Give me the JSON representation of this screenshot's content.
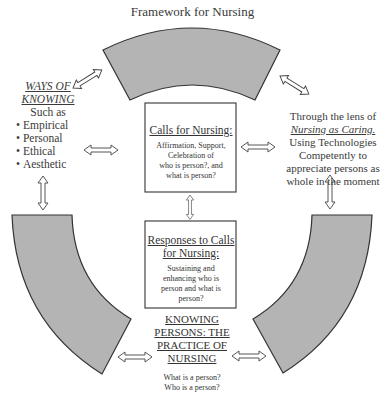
{
  "title": "Framework for Nursing",
  "ways_of_knowing": {
    "heading_line1": "WAYS OF",
    "heading_line2": "KNOWING",
    "intro": "Such as",
    "items": [
      "Empirical",
      "Personal",
      "Ethical",
      "Aesthetic"
    ]
  },
  "lens": {
    "line1": "Through the lens of",
    "emphasis": "Nursing as Caring.",
    "line3": "Using Technologies",
    "line4": "Competently to",
    "line5": "appreciate persons as",
    "line6": "whole in the moment"
  },
  "calls_box": {
    "title": "Calls for Nursing:",
    "body_line1": "Affirmation, Support,",
    "body_line2": "Celebration of",
    "body_line3": "who is person?, and",
    "body_line4": "what is person?"
  },
  "responses_box": {
    "title_line1": "Responses to Calls",
    "title_line2": "for Nursing:",
    "body_line1": "Sustaining and",
    "body_line2": "enhancing who is",
    "body_line3": "person and what is",
    "body_line4": "person?"
  },
  "knowing_persons": {
    "line1": "KNOWING",
    "line2": "PERSONS: THE",
    "line3": "PRACTICE OF",
    "line4": "NURSING",
    "question1": "What is a person?",
    "question2": "Who is a person?"
  },
  "colors": {
    "segment_fill": "#b4b4b4",
    "stroke": "#333333",
    "background": "#ffffff"
  }
}
